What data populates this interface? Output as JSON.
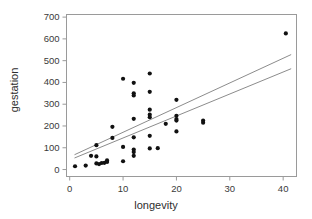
{
  "chart_data": {
    "type": "scatter",
    "title": "",
    "subtitle": "",
    "xlabel": "longevity",
    "ylabel": "gestation",
    "xlim": [
      -0.6,
      42.5
    ],
    "ylim": [
      -32,
      712
    ],
    "grid": false,
    "legend": null,
    "x_ticks": [
      0,
      10,
      20,
      30,
      40
    ],
    "x_tick_labels": [
      "0",
      "10",
      "20",
      "30",
      "40"
    ],
    "y_ticks": [
      0,
      100,
      200,
      300,
      400,
      500,
      600,
      700
    ],
    "y_tick_labels": [
      "0",
      "100",
      "200",
      "300",
      "400",
      "500",
      "600",
      "700"
    ],
    "marker": {
      "shape": "circle",
      "color": "#111111",
      "size_px": 4.2
    },
    "points": [
      {
        "x": 1.0,
        "y": 15
      },
      {
        "x": 3.0,
        "y": 18
      },
      {
        "x": 5.0,
        "y": 112
      },
      {
        "x": 4.0,
        "y": 63
      },
      {
        "x": 5.0,
        "y": 60
      },
      {
        "x": 5.0,
        "y": 28
      },
      {
        "x": 5.5,
        "y": 25
      },
      {
        "x": 6.0,
        "y": 30
      },
      {
        "x": 6.5,
        "y": 31
      },
      {
        "x": 7.0,
        "y": 42
      },
      {
        "x": 7.0,
        "y": 35
      },
      {
        "x": 8.0,
        "y": 196
      },
      {
        "x": 8.0,
        "y": 145
      },
      {
        "x": 10.0,
        "y": 417
      },
      {
        "x": 10.0,
        "y": 104
      },
      {
        "x": 10.0,
        "y": 38
      },
      {
        "x": 12.0,
        "y": 398
      },
      {
        "x": 12.0,
        "y": 350
      },
      {
        "x": 12.0,
        "y": 340
      },
      {
        "x": 12.0,
        "y": 233
      },
      {
        "x": 12.0,
        "y": 148
      },
      {
        "x": 12.0,
        "y": 92
      },
      {
        "x": 12.0,
        "y": 80
      },
      {
        "x": 12.0,
        "y": 63
      },
      {
        "x": 15.0,
        "y": 441
      },
      {
        "x": 15.0,
        "y": 357
      },
      {
        "x": 15.0,
        "y": 275
      },
      {
        "x": 15.0,
        "y": 252
      },
      {
        "x": 15.0,
        "y": 240
      },
      {
        "x": 15.0,
        "y": 155
      },
      {
        "x": 15.0,
        "y": 97
      },
      {
        "x": 16.5,
        "y": 98
      },
      {
        "x": 18.0,
        "y": 210
      },
      {
        "x": 20.0,
        "y": 320
      },
      {
        "x": 20.0,
        "y": 247
      },
      {
        "x": 20.0,
        "y": 232
      },
      {
        "x": 20.0,
        "y": 225
      },
      {
        "x": 20.0,
        "y": 175
      },
      {
        "x": 25.0,
        "y": 225
      },
      {
        "x": 25.0,
        "y": 215
      },
      {
        "x": 40.5,
        "y": 625
      }
    ],
    "fit_lines": [
      {
        "name": "line-upper",
        "x_start": 0.9,
        "y_start": 68,
        "x_end": 41.5,
        "y_end": 528,
        "color": "#8c8c8c",
        "width_px": 1
      },
      {
        "name": "line-lower",
        "x_start": 0.9,
        "y_start": 53,
        "x_end": 41.5,
        "y_end": 463,
        "color": "#8c8c8c",
        "width_px": 1
      }
    ],
    "frame": {
      "color": "#9a9a9a",
      "width_px": 1
    }
  }
}
